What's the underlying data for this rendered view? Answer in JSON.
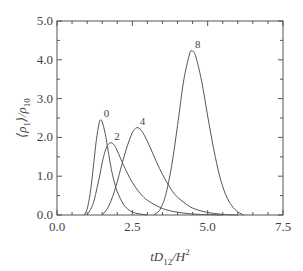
{
  "chart_data": {
    "type": "line",
    "title": "",
    "xlabel": "tD12/H^2",
    "ylabel": "<ρ1>/ρ10",
    "xlim": [
      0.0,
      7.5
    ],
    "ylim": [
      0.0,
      5.0
    ],
    "grid": false,
    "legend": "inline labels at curve peaks",
    "x_ticks": [
      "0.0",
      "2.5",
      "5.0",
      "7.5"
    ],
    "y_ticks": [
      "0.0",
      "1.0",
      "2.0",
      "3.0",
      "4.0",
      "5.0"
    ],
    "series": [
      {
        "name": "0",
        "peak": [
          1.45,
          2.45
        ],
        "x": [
          0.9,
          1.0,
          1.1,
          1.2,
          1.3,
          1.4,
          1.45,
          1.5,
          1.6,
          1.7,
          1.8,
          1.9,
          2.0,
          2.2,
          2.4,
          2.6,
          2.8,
          3.0
        ],
        "y": [
          0.0,
          0.15,
          0.55,
          1.2,
          1.9,
          2.38,
          2.45,
          2.4,
          2.1,
          1.65,
          1.2,
          0.85,
          0.6,
          0.28,
          0.12,
          0.05,
          0.02,
          0.0
        ]
      },
      {
        "name": "2",
        "peak": [
          1.8,
          1.86
        ],
        "x": [
          1.0,
          1.2,
          1.4,
          1.5,
          1.6,
          1.7,
          1.8,
          1.9,
          2.0,
          2.2,
          2.4,
          2.6,
          2.8,
          3.0,
          3.4,
          3.8,
          4.2,
          4.6,
          5.0,
          5.5
        ],
        "y": [
          0.0,
          0.3,
          0.95,
          1.35,
          1.65,
          1.82,
          1.86,
          1.8,
          1.65,
          1.3,
          0.98,
          0.72,
          0.52,
          0.38,
          0.2,
          0.1,
          0.05,
          0.02,
          0.01,
          0.0
        ]
      },
      {
        "name": "4",
        "peak": [
          2.65,
          2.25
        ],
        "x": [
          1.5,
          1.7,
          1.9,
          2.1,
          2.3,
          2.5,
          2.65,
          2.8,
          3.0,
          3.2,
          3.4,
          3.6,
          3.8,
          4.0,
          4.4,
          4.8,
          5.2,
          5.6,
          6.0
        ],
        "y": [
          0.0,
          0.2,
          0.6,
          1.15,
          1.7,
          2.12,
          2.25,
          2.18,
          1.9,
          1.55,
          1.2,
          0.9,
          0.65,
          0.46,
          0.22,
          0.1,
          0.04,
          0.01,
          0.0
        ]
      },
      {
        "name": "8",
        "peak": [
          4.48,
          4.23
        ],
        "x": [
          3.2,
          3.4,
          3.6,
          3.8,
          4.0,
          4.2,
          4.4,
          4.48,
          4.6,
          4.8,
          5.0,
          5.2,
          5.4,
          5.6,
          5.8,
          6.0,
          6.2
        ],
        "y": [
          0.0,
          0.12,
          0.5,
          1.25,
          2.3,
          3.45,
          4.15,
          4.23,
          4.1,
          3.45,
          2.55,
          1.7,
          1.0,
          0.52,
          0.24,
          0.08,
          0.0
        ]
      }
    ]
  },
  "axes": {
    "y_label_main": "⟨ρ",
    "y_label_sub1": "1",
    "y_label_mid": "⟩/ρ",
    "y_label_sub2": "10",
    "x_label_main": "tD",
    "x_label_sub": "12",
    "x_label_tail": "/H",
    "x_label_sup": "2"
  },
  "colors": {
    "axis": "#555555",
    "curve": "#555555",
    "text": "#444444"
  }
}
